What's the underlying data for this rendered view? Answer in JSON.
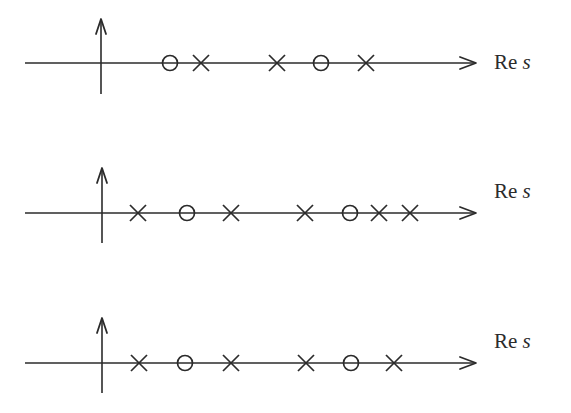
{
  "diagram": {
    "title": "",
    "stroke_color": "#2b2b2b",
    "axis_label": {
      "prefix": "Re",
      "variable": "s"
    },
    "rows": [
      {
        "name": "pole-zero-row-1",
        "axis_y": 63,
        "vaxis": {
          "x": 101,
          "top": 19,
          "bottom": 94
        },
        "label_x": 494,
        "label_top": 52,
        "marks": [
          {
            "type": "zero",
            "x": 170
          },
          {
            "type": "pole",
            "x": 201
          },
          {
            "type": "pole",
            "x": 277
          },
          {
            "type": "zero",
            "x": 321
          },
          {
            "type": "pole",
            "x": 366
          }
        ]
      },
      {
        "name": "pole-zero-row-2",
        "axis_y": 213,
        "vaxis": {
          "x": 102,
          "top": 168,
          "bottom": 243
        },
        "label_x": 494,
        "label_top": 181,
        "marks": [
          {
            "type": "pole",
            "x": 138
          },
          {
            "type": "zero",
            "x": 187
          },
          {
            "type": "pole",
            "x": 231
          },
          {
            "type": "pole",
            "x": 305
          },
          {
            "type": "zero",
            "x": 350
          },
          {
            "type": "pole",
            "x": 379
          },
          {
            "type": "pole",
            "x": 410
          }
        ]
      },
      {
        "name": "pole-zero-row-3",
        "axis_y": 363,
        "vaxis": {
          "x": 102,
          "top": 318,
          "bottom": 393
        },
        "label_x": 494,
        "label_top": 331,
        "marks": [
          {
            "type": "pole",
            "x": 139
          },
          {
            "type": "zero",
            "x": 185
          },
          {
            "type": "pole",
            "x": 231
          },
          {
            "type": "pole",
            "x": 306
          },
          {
            "type": "zero",
            "x": 351
          },
          {
            "type": "pole",
            "x": 394
          }
        ]
      }
    ],
    "axis_start_x": 25,
    "axis_end_x": 476
  }
}
